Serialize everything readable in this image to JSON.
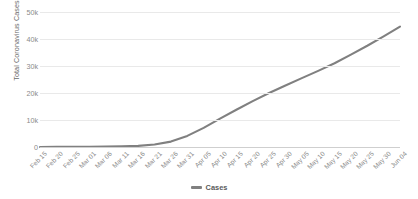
{
  "chart_data": {
    "type": "line",
    "title": "",
    "xlabel": "",
    "ylabel": "Total Coronavirus Cases",
    "ylim": [
      0,
      50000
    ],
    "grid": true,
    "legend_position": "bottom",
    "legend": [
      "Cases"
    ],
    "line_color": "#808080",
    "y_ticks": [
      "0",
      "10k",
      "20k",
      "30k",
      "40k",
      "50k"
    ],
    "y_tick_values": [
      0,
      10000,
      20000,
      30000,
      40000,
      50000
    ],
    "categories": [
      "Feb 15",
      "Feb 20",
      "Feb 25",
      "Mar 01",
      "Mar 06",
      "Mar 11",
      "Mar 16",
      "Mar 21",
      "Mar 26",
      "Mar 31",
      "Apr 05",
      "Apr 10",
      "Apr 15",
      "Apr 20",
      "Apr 25",
      "Apr 30",
      "May 05",
      "May 10",
      "May 15",
      "May 20",
      "May 25",
      "May 30",
      "Jun 04"
    ],
    "series": [
      {
        "name": "Cases",
        "values": [
          20,
          35,
          60,
          95,
          150,
          230,
          420,
          900,
          2000,
          4100,
          7100,
          10500,
          13800,
          17000,
          20000,
          22800,
          25500,
          28200,
          31000,
          34200,
          37500,
          41000,
          44600
        ]
      }
    ]
  },
  "legend": {
    "cases_label": "Cases"
  },
  "axis": {
    "y_title": "Total Coronavirus Cases"
  }
}
